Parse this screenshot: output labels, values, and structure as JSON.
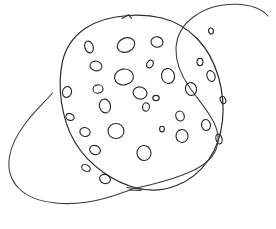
{
  "image": {
    "kind": "hand-drawn-sketch",
    "subject": "planet-with-ring",
    "alt_text": "A simple hand-drawn black ink sketch of a cratered planet encircled by a ring",
    "width": 276,
    "height": 229,
    "background_color": "#ffffff",
    "ink_color": "#2b2b2b",
    "ring_ink_color": "#3a3a3a",
    "stroke_width": 1.1
  },
  "strokes": {
    "planet_outline": {
      "name": "planet-body",
      "description": "Irregular closed hand-drawn circle forming the planet body, with a small kink at the top",
      "path": "M 128.5 15.5 C 112 16.5 97 20.5 85 28.5 C 73.5 36.5 65.5 48 62.5 61.5 C 59.5 75 59.5 89 61.5 102.5 C 63.5 116 67.5 129.5 74.5 141.5 C 81.5 153.5 91.5 164 103.5 172.5 C 113.5 179.5 124.5 185 136.5 188 C 150 191.5 164 190.5 176.5 185.5 C 189.5 180.5 200.5 171.5 208.5 160 C 216.5 148.5 221 134.5 222.5 120.5 C 224 106 222.5 91 218.5 77 C 214.5 63 207.5 49.5 197.5 39 C 188 29 175.5 21.5 162 18 C 151.5 15.5 140 14.5 128.5 15.5 Z"
    },
    "planet_top_kink": {
      "name": "planet-top-notch",
      "description": "Small angular notch in the outline at the top of the planet",
      "path": "M 122 18.5 L 128.5 14.8 L 131.5 18.2"
    },
    "ring_front": {
      "name": "ring-front-arc",
      "description": "Near/front half of the ring sweeping from upper-right, behind the planet's right side, down to the lower-left convergence point",
      "path": "M 268 16 C 262 9 250 4.5 236 4.2 C 221 4 205.5 8 194 16.5 C 183 24.5 176.5 36 176 48.5 C 175.5 62 181 75 189 86.5 C 196.5 97.5 205.5 107.5 212 119 C 217.5 128.5 220 139.5 216 149.5 C 212 159.5 202 166.5 191 171.5 C 178 177.5 163.5 181.5 149.5 185 C 144.5 186.2 139.5 187.3 134.5 188.3"
    },
    "ring_back": {
      "name": "ring-back-arc",
      "description": "Far/back half of the ring sweeping from the upper-left near the planet edge, out to the far left, around the bottom and back to the convergence point",
      "path": "M 52.5 93 C 44 102.5 34 112 26 122.5 C 18 133 11.5 144.5 9.5 156.5 C 7.5 168.5 10.5 180 19 188.5 C 27.5 197 41 201.5 55.5 203 C 72 204.7 90 202.5 106 198 C 116 195.2 125.5 191.8 134.5 188.3"
    },
    "ring_convergence": {
      "name": "ring-convergence-point",
      "description": "Short doubled stroke where the two ring arcs meet below the planet",
      "path": "M 127 187.5 L 143 189.5 M 129 190 L 141 190.5"
    }
  },
  "craters": [
    {
      "name": "crater-01",
      "cx": 89,
      "cy": 47,
      "rx": 4.2,
      "ry": 6.0,
      "rot": -18
    },
    {
      "name": "crater-02",
      "cx": 126,
      "cy": 45,
      "rx": 9.0,
      "ry": 7.0,
      "rot": -24
    },
    {
      "name": "crater-03",
      "cx": 157,
      "cy": 42,
      "rx": 6.0,
      "ry": 5.2,
      "rot": 10
    },
    {
      "name": "crater-04",
      "cx": 96,
      "cy": 66,
      "rx": 6.0,
      "ry": 4.8,
      "rot": 12
    },
    {
      "name": "crater-05",
      "cx": 124,
      "cy": 77,
      "rx": 9.5,
      "ry": 8.0,
      "rot": -8
    },
    {
      "name": "crater-06",
      "cx": 150,
      "cy": 64,
      "rx": 3.0,
      "ry": 4.0,
      "rot": 30
    },
    {
      "name": "crater-07",
      "cx": 168,
      "cy": 76,
      "rx": 6.5,
      "ry": 7.5,
      "rot": -12
    },
    {
      "name": "crater-08",
      "cx": 211,
      "cy": 76,
      "rx": 4.0,
      "ry": 5.5,
      "rot": -20
    },
    {
      "name": "crater-09",
      "cx": 67,
      "cy": 92,
      "rx": 4.5,
      "ry": 5.5,
      "rot": 14
    },
    {
      "name": "crater-10",
      "cx": 98,
      "cy": 89,
      "rx": 5.0,
      "ry": 4.2,
      "rot": -6
    },
    {
      "name": "crater-11",
      "cx": 140,
      "cy": 93,
      "rx": 7.0,
      "ry": 6.0,
      "rot": 18
    },
    {
      "name": "crater-12",
      "cx": 156,
      "cy": 98,
      "rx": 3.2,
      "ry": 2.6,
      "rot": 0
    },
    {
      "name": "crater-13",
      "cx": 191,
      "cy": 89,
      "rx": 5.5,
      "ry": 6.5,
      "rot": -15
    },
    {
      "name": "crater-14",
      "cx": 223,
      "cy": 100,
      "rx": 2.6,
      "ry": 3.8,
      "rot": -22
    },
    {
      "name": "crater-15",
      "cx": 105,
      "cy": 106,
      "rx": 5.5,
      "ry": 7.0,
      "rot": -14
    },
    {
      "name": "crater-16",
      "cx": 146,
      "cy": 107,
      "rx": 3.4,
      "ry": 4.2,
      "rot": 8
    },
    {
      "name": "crater-17",
      "cx": 70,
      "cy": 117,
      "rx": 4.2,
      "ry": 3.4,
      "rot": 22
    },
    {
      "name": "crater-18",
      "cx": 180,
      "cy": 116,
      "rx": 4.2,
      "ry": 5.0,
      "rot": -18
    },
    {
      "name": "crater-19",
      "cx": 206,
      "cy": 125,
      "rx": 4.5,
      "ry": 5.5,
      "rot": -10
    },
    {
      "name": "crater-20",
      "cx": 85,
      "cy": 132,
      "rx": 5.2,
      "ry": 4.4,
      "rot": 16
    },
    {
      "name": "crater-21",
      "cx": 116,
      "cy": 131,
      "rx": 8.0,
      "ry": 7.5,
      "rot": 0
    },
    {
      "name": "crater-22",
      "cx": 182,
      "cy": 136,
      "rx": 6.0,
      "ry": 6.5,
      "rot": -8
    },
    {
      "name": "crater-23",
      "cx": 219,
      "cy": 139,
      "rx": 3.0,
      "ry": 5.0,
      "rot": -15
    },
    {
      "name": "crater-24",
      "cx": 95,
      "cy": 150,
      "rx": 5.5,
      "ry": 4.5,
      "rot": 24
    },
    {
      "name": "crater-25",
      "cx": 144,
      "cy": 153,
      "rx": 7.0,
      "ry": 7.5,
      "rot": -6
    },
    {
      "name": "crater-26",
      "cx": 86,
      "cy": 168,
      "rx": 4.5,
      "ry": 3.2,
      "rot": 28
    },
    {
      "name": "crater-27",
      "cx": 105,
      "cy": 179,
      "rx": 5.5,
      "ry": 4.5,
      "rot": 20
    },
    {
      "name": "crater-28",
      "cx": 200,
      "cy": 62,
      "rx": 3.0,
      "ry": 3.6,
      "rot": 0
    },
    {
      "name": "crater-29",
      "cx": 162,
      "cy": 129,
      "rx": 2.4,
      "ry": 2.8,
      "rot": 0
    },
    {
      "name": "crater-30",
      "cx": 211,
      "cy": 31,
      "rx": 2.4,
      "ry": 3.0,
      "rot": -10
    }
  ]
}
